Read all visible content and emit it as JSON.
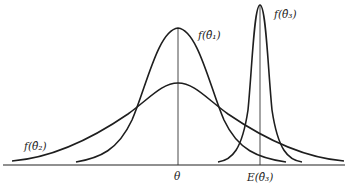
{
  "diagram": {
    "type": "probability-density-comparison",
    "labels": {
      "f_theta1": "f(θ̂₁)",
      "f_theta2": "f(θ̂₂)",
      "f_theta3": "f(θ̂₃)",
      "theta": "θ",
      "expected_theta3": "E(θ̂₃)"
    },
    "curves": [
      {
        "name": "f(θ̂₁)",
        "center": "θ",
        "shape": "unbiased, narrow",
        "peak_height": "high"
      },
      {
        "name": "f(θ̂₂)",
        "center": "θ",
        "shape": "unbiased, wide",
        "peak_height": "low"
      },
      {
        "name": "f(θ̂₃)",
        "center": "E(θ̂₃)",
        "shape": "biased, very narrow",
        "peak_height": "highest"
      }
    ],
    "colors": {
      "line": "#1e1e1e",
      "background": "#ffffff"
    }
  }
}
